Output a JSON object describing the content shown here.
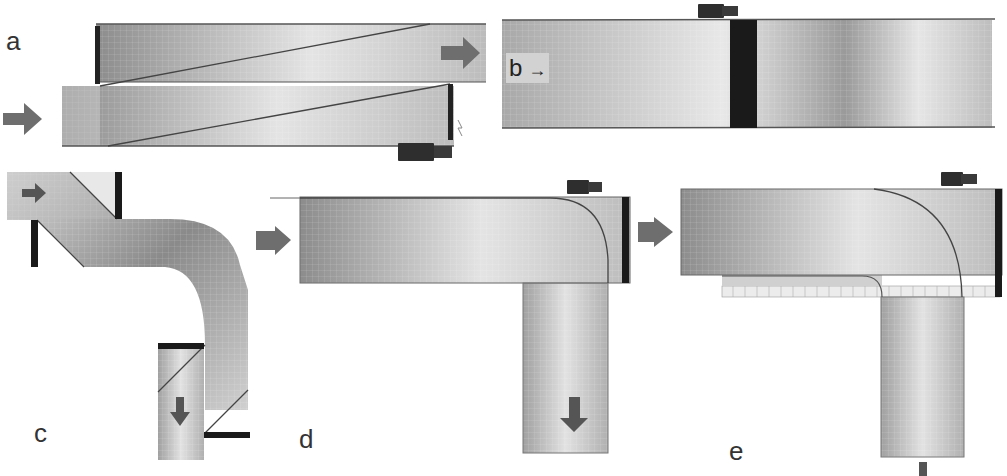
{
  "figure": {
    "panels": [
      {
        "id": "a",
        "label": "a",
        "description": "Diagonal pipe sections with transducer, flow arrows in and out"
      },
      {
        "id": "b",
        "label": "b",
        "description": "Straight pipe with clamp-on transducer at dark band",
        "inline_text": "b",
        "inline_arrow": "→"
      },
      {
        "id": "c",
        "label": "c",
        "description": "S-bend pipe with inlet and outlet sections"
      },
      {
        "id": "d",
        "label": "d",
        "description": "L-shaped pipe with curved flow line and transducer at corner"
      },
      {
        "id": "e",
        "label": "e",
        "description": "L-shaped pipe with curved flow line, grid liner and transducer"
      }
    ],
    "caption_partial": ""
  },
  "colors": {
    "pipe_dark": "#8a8a8a",
    "pipe_light": "#e6e6e6",
    "band": "#1a1a1a",
    "arrow": "#6e6e6e",
    "transducer": "#2e2e2e",
    "outline": "#555555"
  }
}
